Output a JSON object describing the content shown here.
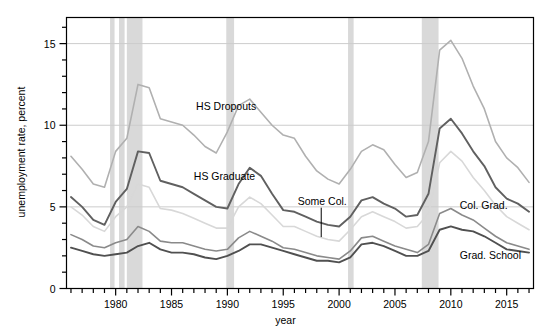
{
  "chart_data": {
    "type": "line",
    "title": "",
    "xlabel": "year",
    "ylabel": "unemployment rate, percent",
    "xlim": [
      1975.6,
      1977.0
    ],
    "x_axis": {
      "min": 1975.6,
      "max": 2017.4,
      "major_step": 5,
      "minor_step": 1,
      "major_ticks": [
        1980,
        1985,
        1990,
        1995,
        2000,
        2005,
        2010,
        2015
      ],
      "tick_labels": [
        "1980",
        "1985",
        "1990",
        "1995",
        "2000",
        "2005",
        "2010",
        "2015"
      ]
    },
    "y_axis": {
      "min": 0,
      "max": 16.6,
      "major_step": 5,
      "minor_step": 1,
      "major_ticks": [
        0,
        5,
        10,
        15
      ],
      "tick_labels": [
        "0",
        "5",
        "10",
        "15"
      ]
    },
    "ylim": [
      0,
      16.6
    ],
    "grid": "horizontal-major-only",
    "legend_position": "inline-annotations",
    "x": [
      1976,
      1977,
      1978,
      1979,
      1980,
      1981,
      1982,
      1983,
      1984,
      1985,
      1986,
      1987,
      1988,
      1989,
      1990,
      1991,
      1992,
      1993,
      1994,
      1995,
      1996,
      1997,
      1998,
      1999,
      2000,
      2001,
      2002,
      2003,
      2004,
      2005,
      2006,
      2007,
      2008,
      2009,
      2010,
      2011,
      2012,
      2013,
      2014,
      2015,
      2016,
      2017
    ],
    "series": [
      {
        "name": "HS Dropouts",
        "label": "HS Dropouts",
        "color": "#b0b0b0",
        "width": 1.6,
        "values": [
          8.1,
          7.3,
          6.4,
          6.2,
          8.4,
          9.2,
          12.5,
          12.3,
          10.4,
          10.2,
          10.0,
          9.4,
          8.7,
          8.3,
          9.6,
          11.2,
          11.6,
          10.8,
          10.0,
          9.4,
          9.2,
          8.1,
          7.2,
          6.7,
          6.4,
          7.3,
          8.4,
          8.8,
          8.5,
          7.6,
          6.8,
          7.1,
          9.0,
          14.6,
          15.2,
          14.1,
          12.4,
          11.0,
          9.0,
          8.0,
          7.4,
          6.5
        ]
      },
      {
        "name": "HS Graduate",
        "label": "HS Graduate",
        "color": "#606060",
        "width": 1.9,
        "values": [
          5.6,
          5.0,
          4.2,
          3.9,
          5.3,
          6.1,
          8.4,
          8.3,
          6.6,
          6.4,
          6.2,
          5.8,
          5.4,
          5.0,
          4.9,
          6.4,
          7.4,
          6.9,
          5.8,
          4.8,
          4.7,
          4.4,
          4.1,
          3.9,
          3.8,
          4.4,
          5.4,
          5.6,
          5.2,
          4.9,
          4.4,
          4.5,
          5.8,
          9.8,
          10.4,
          9.5,
          8.4,
          7.5,
          6.2,
          5.5,
          5.2,
          4.7
        ]
      },
      {
        "name": "Some College",
        "label": "Some Col.",
        "color": "#d8d8d8",
        "width": 1.6,
        "values": [
          5.0,
          4.5,
          3.8,
          3.5,
          4.4,
          5.0,
          6.4,
          6.2,
          4.9,
          4.8,
          4.6,
          4.3,
          4.0,
          3.7,
          3.7,
          5.0,
          5.6,
          5.2,
          4.5,
          3.8,
          3.8,
          3.5,
          3.2,
          3.0,
          2.9,
          3.6,
          4.4,
          4.7,
          4.4,
          4.1,
          3.7,
          3.8,
          4.6,
          7.7,
          8.4,
          7.8,
          6.8,
          6.0,
          5.1,
          4.4,
          4.0,
          3.6
        ]
      },
      {
        "name": "College Graduate",
        "label": "Col. Grad.",
        "color": "#8a8a8a",
        "width": 1.6,
        "values": [
          3.3,
          3.0,
          2.6,
          2.5,
          2.8,
          3.0,
          3.8,
          3.5,
          2.9,
          2.8,
          2.8,
          2.6,
          2.4,
          2.3,
          2.4,
          3.1,
          3.5,
          3.2,
          2.9,
          2.5,
          2.4,
          2.2,
          2.0,
          1.9,
          1.8,
          2.3,
          3.1,
          3.2,
          2.9,
          2.6,
          2.4,
          2.2,
          2.7,
          4.6,
          4.9,
          4.5,
          4.2,
          3.7,
          3.2,
          2.8,
          2.6,
          2.4
        ]
      },
      {
        "name": "Graduate School",
        "label": "Grad. School",
        "color": "#505050",
        "width": 1.9,
        "values": [
          2.5,
          2.3,
          2.1,
          2.0,
          2.1,
          2.2,
          2.6,
          2.8,
          2.4,
          2.2,
          2.2,
          2.1,
          1.9,
          1.8,
          2.0,
          2.3,
          2.7,
          2.7,
          2.5,
          2.3,
          2.1,
          1.9,
          1.7,
          1.7,
          1.6,
          1.9,
          2.7,
          2.8,
          2.6,
          2.3,
          2.0,
          2.0,
          2.3,
          3.6,
          3.8,
          3.6,
          3.5,
          3.2,
          2.8,
          2.4,
          2.3,
          2.2
        ]
      }
    ],
    "recession_bands": [
      {
        "start": 1979.5,
        "end": 1979.9
      },
      {
        "start": 1980.3,
        "end": 1980.8
      },
      {
        "start": 1981.0,
        "end": 1982.4
      },
      {
        "start": 1989.9,
        "end": 1990.6
      },
      {
        "start": 2000.8,
        "end": 2001.3
      },
      {
        "start": 2007.4,
        "end": 2008.9
      }
    ],
    "recession_color": "#d9d9d9",
    "annotations": [
      {
        "text": "HS Dropouts",
        "x": 1987.2,
        "y": 11.2,
        "anchor": "start",
        "leader": null
      },
      {
        "text": "HS Graduate",
        "x": 1987.0,
        "y": 6.9,
        "anchor": "start",
        "leader": null
      },
      {
        "text": "Some Col.",
        "x": 1996.3,
        "y": 5.35,
        "anchor": "start",
        "leader": {
          "x": 1998.4,
          "y1": 4.95,
          "y2": 3.15
        }
      },
      {
        "text": "Col. Grad.",
        "x": 2010.8,
        "y": 5.1,
        "anchor": "start",
        "leader": null
      },
      {
        "text": "Grad. School",
        "x": 2010.8,
        "y": 2.05,
        "anchor": "start",
        "leader": null
      }
    ]
  },
  "figure": {
    "background_color": "#ffffff",
    "frame_color": "#000000",
    "gridline_color": "#cccccc"
  }
}
